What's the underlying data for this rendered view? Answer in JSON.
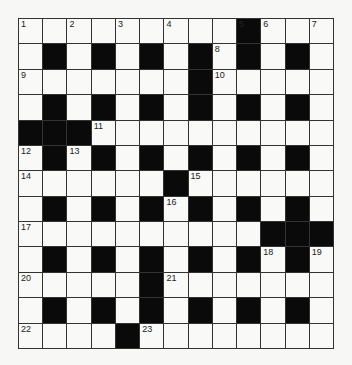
{
  "puzzle": {
    "rows": 13,
    "cols": 13,
    "colors": {
      "black": "#0a0a0a",
      "white": "#f9f9f7",
      "line": "#333333",
      "background": "#f7f7f5"
    },
    "grid": [
      ".........#...",
      ".#.#.#.#.#.#.",
      ".......#.....",
      ".#.#.#.#.#.#.",
      "###..........",
      ".#.#.#.#.#.#.",
      "......#......",
      ".#.#.#.#.#.#.",
      "..........###",
      ".#.#.#.#.#.#.",
      ".....#.......",
      ".#.#.#.#.#.#.",
      "....#........"
    ],
    "numbers": [
      {
        "n": "1",
        "r": 0,
        "c": 0
      },
      {
        "n": "2",
        "r": 0,
        "c": 2
      },
      {
        "n": "3",
        "r": 0,
        "c": 4
      },
      {
        "n": "4",
        "r": 0,
        "c": 6
      },
      {
        "n": "5",
        "r": 0,
        "c": 9
      },
      {
        "n": "6",
        "r": 0,
        "c": 10
      },
      {
        "n": "7",
        "r": 0,
        "c": 12
      },
      {
        "n": "8",
        "r": 1,
        "c": 8
      },
      {
        "n": "9",
        "r": 2,
        "c": 0
      },
      {
        "n": "10",
        "r": 2,
        "c": 8
      },
      {
        "n": "11",
        "r": 4,
        "c": 3
      },
      {
        "n": "12",
        "r": 5,
        "c": 0
      },
      {
        "n": "13",
        "r": 5,
        "c": 2
      },
      {
        "n": "14",
        "r": 6,
        "c": 0
      },
      {
        "n": "15",
        "r": 6,
        "c": 7
      },
      {
        "n": "16",
        "r": 7,
        "c": 6
      },
      {
        "n": "17",
        "r": 8,
        "c": 0
      },
      {
        "n": "18",
        "r": 9,
        "c": 10
      },
      {
        "n": "19",
        "r": 9,
        "c": 12
      },
      {
        "n": "20",
        "r": 10,
        "c": 0
      },
      {
        "n": "21",
        "r": 10,
        "c": 6
      },
      {
        "n": "22",
        "r": 12,
        "c": 0
      },
      {
        "n": "23",
        "r": 12,
        "c": 5
      }
    ]
  }
}
